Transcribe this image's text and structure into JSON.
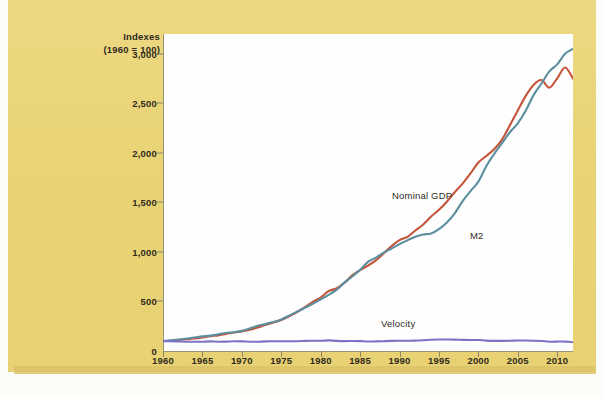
{
  "figure": {
    "background_color": "#ecd781",
    "plot_background_color": "#ffffff"
  },
  "chart_data": {
    "type": "line",
    "title": "",
    "subtitle": "",
    "xlabel": "",
    "ylabel": "Indexes (1960 = 100)",
    "ylabel_line1": "Indexes",
    "ylabel_line2": "(1960 = 100)",
    "xlim": [
      1960,
      2012
    ],
    "ylim": [
      0,
      3200
    ],
    "yticks": [
      0,
      500,
      1000,
      1500,
      2000,
      2500,
      3000
    ],
    "ytick_labels": [
      "0",
      "500",
      "1,000",
      "1,500",
      "2,000",
      "2,500",
      "3,000"
    ],
    "xticks": [
      1960,
      1965,
      1970,
      1975,
      1980,
      1985,
      1990,
      1995,
      2000,
      2005,
      2010
    ],
    "xtick_labels": [
      "1960",
      "1965",
      "1970",
      "1975",
      "1980",
      "1985",
      "1990",
      "1995",
      "2000",
      "2005",
      "2010"
    ],
    "grid": false,
    "legend_position": "inline-annotations",
    "x": [
      1960,
      1961,
      1962,
      1963,
      1964,
      1965,
      1966,
      1967,
      1968,
      1969,
      1970,
      1971,
      1972,
      1973,
      1974,
      1975,
      1976,
      1977,
      1978,
      1979,
      1980,
      1981,
      1982,
      1983,
      1984,
      1985,
      1986,
      1987,
      1988,
      1989,
      1990,
      1991,
      1992,
      1993,
      1994,
      1995,
      1996,
      1997,
      1998,
      1999,
      2000,
      2001,
      2002,
      2003,
      2004,
      2005,
      2006,
      2007,
      2008,
      2009,
      2010,
      2011,
      2012
    ],
    "series": [
      {
        "name": "Nominal GDP",
        "color": "#c4543a",
        "label_text": "Nominal GDP",
        "values": [
          100,
          104,
          111,
          118,
          126,
          137,
          150,
          158,
          173,
          187,
          197,
          214,
          236,
          264,
          287,
          313,
          350,
          392,
          444,
          496,
          540,
          605,
          632,
          688,
          763,
          817,
          862,
          915,
          986,
          1060,
          1119,
          1152,
          1216,
          1277,
          1357,
          1425,
          1507,
          1603,
          1690,
          1792,
          1903,
          1969,
          2036,
          2134,
          2280,
          2428,
          2575,
          2686,
          2735,
          2658,
          2753,
          2862,
          2750
        ]
      },
      {
        "name": "M2",
        "color": "#5b8e9e",
        "label_text": "M2",
        "values": [
          100,
          107,
          116,
          126,
          136,
          148,
          155,
          168,
          182,
          190,
          203,
          228,
          254,
          273,
          292,
          318,
          357,
          397,
          436,
          477,
          522,
          566,
          617,
          690,
          752,
          819,
          899,
          943,
          993,
          1035,
          1079,
          1117,
          1153,
          1176,
          1186,
          1230,
          1297,
          1390,
          1512,
          1614,
          1710,
          1866,
          1990,
          2099,
          2208,
          2299,
          2425,
          2583,
          2700,
          2822,
          2893,
          3000,
          3050
        ]
      },
      {
        "name": "Velocity",
        "color": "#7f72c4",
        "label_text": "Velocity",
        "values": [
          100,
          98,
          96,
          94,
          93,
          93,
          97,
          94,
          95,
          98,
          97,
          94,
          93,
          97,
          98,
          98,
          98,
          99,
          102,
          104,
          103,
          107,
          102,
          100,
          101,
          100,
          96,
          97,
          99,
          102,
          104,
          103,
          105,
          109,
          114,
          116,
          116,
          115,
          112,
          111,
          111,
          105,
          102,
          102,
          103,
          106,
          106,
          104,
          101,
          94,
          95,
          95,
          90
        ]
      }
    ]
  }
}
